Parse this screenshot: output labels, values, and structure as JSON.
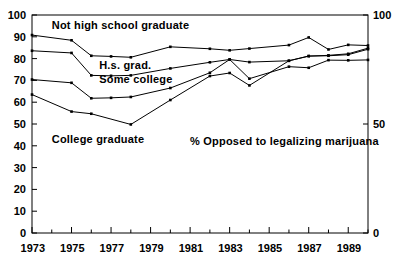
{
  "chart_data": {
    "type": "line",
    "title": "",
    "annotation": "% Opposed to legalizing marijuana",
    "xlabel": "",
    "ylabel": "",
    "xlim": [
      1973,
      1990
    ],
    "ylim": [
      0,
      100
    ],
    "grid": false,
    "legend_position": "inline-labels",
    "x": [
      1973,
      1974,
      1975,
      1976,
      1977,
      1978,
      1979,
      1980,
      1981,
      1982,
      1983,
      1984,
      1985,
      1986,
      1987,
      1988,
      1989,
      1990
    ],
    "xticks_major": [
      1973,
      1975,
      1977,
      1979,
      1981,
      1983,
      1985,
      1987,
      1989
    ],
    "xticks_all": [
      1973,
      1974,
      1975,
      1976,
      1977,
      1978,
      1979,
      1980,
      1981,
      1982,
      1983,
      1984,
      1985,
      1986,
      1987,
      1988,
      1989,
      1990
    ],
    "yticks_left": [
      0,
      10,
      20,
      30,
      40,
      50,
      60,
      70,
      80,
      90,
      100
    ],
    "yticks_right": [
      0,
      50,
      100
    ],
    "series": [
      {
        "name": "Not high school graduate",
        "label_x": 1974.0,
        "label_y": 95.5,
        "x": [
          1973,
          1975,
          1976,
          1977,
          1978,
          1980,
          1982,
          1983,
          1984,
          1986,
          1987,
          1988,
          1989,
          1990
        ],
        "values": [
          90.8,
          88.4,
          81.3,
          81.0,
          80.6,
          85.4,
          84.5,
          83.8,
          84.6,
          86.2,
          89.7,
          84.2,
          86.3,
          86.0
        ]
      },
      {
        "name": "H.s. grad.",
        "label_x": 1976.4,
        "label_y": 77.0,
        "x": [
          1973,
          1975,
          1976,
          1977,
          1978,
          1980,
          1982,
          1983,
          1984,
          1986,
          1987,
          1988,
          1989,
          1990
        ],
        "values": [
          83.6,
          82.6,
          72.3,
          72.1,
          72.3,
          75.5,
          78.3,
          79.6,
          78.4,
          79.0,
          81.2,
          81.3,
          81.8,
          84.3
        ]
      },
      {
        "name": "Some college",
        "label_x": 1976.4,
        "label_y": 70.5,
        "x": [
          1973,
          1975,
          1976,
          1977,
          1978,
          1980,
          1982,
          1983,
          1984,
          1986,
          1987,
          1988,
          1989,
          1990
        ],
        "values": [
          70.4,
          68.9,
          61.8,
          62.0,
          62.4,
          66.5,
          73.5,
          79.6,
          70.8,
          76.3,
          75.8,
          79.3,
          79.2,
          79.4
        ]
      },
      {
        "name": "College graduate",
        "label_x": 1974.0,
        "label_y": 43.0,
        "x": [
          1973,
          1975,
          1976,
          1978,
          1980,
          1982,
          1983,
          1984,
          1986,
          1987,
          1988,
          1989,
          1990
        ],
        "values": [
          63.5,
          55.7,
          54.7,
          49.8,
          61.0,
          72.0,
          73.4,
          67.7,
          79.0,
          81.1,
          81.5,
          82.2,
          84.8
        ]
      }
    ],
    "colors": {
      "line": "#000000",
      "axis": "#000000",
      "background": "#ffffff",
      "marker": "#000000"
    }
  },
  "axes": {
    "left_labels": [
      "100",
      "90",
      "80",
      "70",
      "60",
      "50",
      "40",
      "30",
      "20",
      "10",
      "0"
    ],
    "right_labels": [
      "100",
      "50",
      "0"
    ],
    "x_labels": [
      "1973",
      "1975",
      "1977",
      "1979",
      "1981",
      "1983",
      "1985",
      "1987",
      "1989"
    ]
  },
  "labels": {
    "series_0": "Not high school graduate",
    "series_1": "H.s. grad.",
    "series_2": "Some college",
    "series_3": "College graduate",
    "annotation": "% Opposed to legalizing marijuana"
  }
}
